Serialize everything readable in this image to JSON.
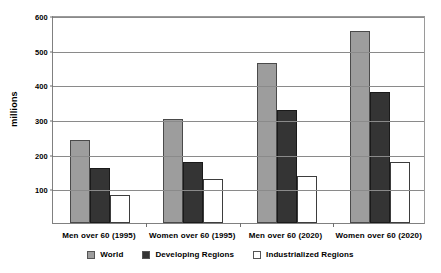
{
  "chart_data": {
    "type": "bar",
    "title": "",
    "xlabel": "",
    "ylabel": "millions",
    "ylim": [
      0,
      600
    ],
    "ytick_values": [
      100,
      200,
      300,
      400,
      500,
      600
    ],
    "ytick_labels": [
      "100",
      "200",
      "300",
      "400",
      "500",
      "600"
    ],
    "grid": true,
    "legend_position": "bottom",
    "categories": [
      "Men over 60 (1995)",
      "Women over 60 (1995)",
      "Men over 60 (2020)",
      "Women over 60 (2020)"
    ],
    "series": [
      {
        "name": "World",
        "color": "#9d9d9d",
        "values": [
          240,
          300,
          462,
          553
        ]
      },
      {
        "name": "Developing Regions",
        "color": "#343434",
        "values": [
          160,
          176,
          327,
          379
        ]
      },
      {
        "name": "Industrialized Regions",
        "color": "#ffffff",
        "values": [
          80,
          127,
          137,
          177
        ]
      }
    ]
  },
  "legend": {
    "items": [
      {
        "label": "World",
        "swatch": "world"
      },
      {
        "label": "Developing Regions",
        "swatch": "developing"
      },
      {
        "label": "Industrialized Regions",
        "swatch": "industrialized"
      }
    ]
  }
}
